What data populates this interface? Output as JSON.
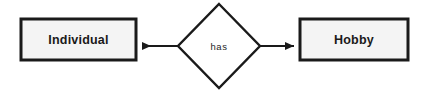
{
  "diagram": {
    "type": "entity-relationship-diagram",
    "background_color": "#ffffff",
    "entities": [
      {
        "id": "individual",
        "label": "Individual",
        "shape": "rectangle",
        "fill_color": "#f4f4f4",
        "border_color": "#1a1a1a",
        "x": 21,
        "y": 19,
        "width": 115,
        "height": 41
      },
      {
        "id": "hobby",
        "label": "Hobby",
        "shape": "rectangle",
        "fill_color": "#f4f4f4",
        "border_color": "#1a1a1a",
        "x": 300,
        "y": 19,
        "width": 108,
        "height": 41
      }
    ],
    "relationships": [
      {
        "id": "has",
        "label": "has",
        "shape": "diamond",
        "fill_color": "#ffffff",
        "border_color": "#1a1a1a",
        "center_x": 219,
        "center_y": 46,
        "half_width": 41,
        "half_height": 42
      }
    ],
    "connectors": [
      {
        "id": "has-to-individual",
        "from": "has",
        "to": "individual",
        "direction": "left",
        "arrowhead": "filled-triangle",
        "color": "#1a1a1a",
        "start_x": 178,
        "end_x": 137,
        "y": 46
      },
      {
        "id": "has-to-hobby",
        "from": "has",
        "to": "hobby",
        "direction": "right",
        "arrowhead": "filled-triangle",
        "color": "#1a1a1a",
        "start_x": 260,
        "end_x": 299,
        "y": 46
      }
    ]
  }
}
